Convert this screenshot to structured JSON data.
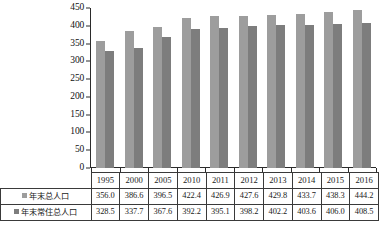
{
  "chart_data": {
    "type": "bar",
    "title": "",
    "xlabel": "",
    "ylabel": "",
    "ylim": [
      0,
      450
    ],
    "ytick_step": 50,
    "yticks": [
      0,
      50,
      100,
      150,
      200,
      250,
      300,
      350,
      400,
      450
    ],
    "grid": false,
    "legend_position": "table-row-headers",
    "categories": [
      "1995",
      "2000",
      "2005",
      "2010",
      "2011",
      "2012",
      "2013",
      "2014",
      "2015",
      "2016"
    ],
    "series": [
      {
        "name": "年末总人口",
        "color": "#9d9d9d",
        "values": [
          356.0,
          386.6,
          396.5,
          422.4,
          426.9,
          427.6,
          429.8,
          433.7,
          438.3,
          444.2
        ]
      },
      {
        "name": "年末常住总人口",
        "color": "#7d7d7d",
        "values": [
          328.5,
          337.7,
          367.6,
          392.2,
          395.1,
          398.2,
          402.2,
          403.6,
          406.0,
          408.5
        ]
      }
    ]
  },
  "table": {
    "corner_label": "",
    "column_headers": [
      "1995",
      "2000",
      "2005",
      "2010",
      "2011",
      "2012",
      "2013",
      "2014",
      "2015",
      "2016"
    ],
    "rows": [
      {
        "label": "年末总人口",
        "swatch_color": "#9d9d9d",
        "values": [
          "356.0",
          "386.6",
          "396.5",
          "422.4",
          "426.9",
          "427.6",
          "429.8",
          "433.7",
          "438.3",
          "444.2"
        ]
      },
      {
        "label": "年末常住总人口",
        "swatch_color": "#7d7d7d",
        "values": [
          "328.5",
          "337.7",
          "367.6",
          "392.2",
          "395.1",
          "398.2",
          "402.2",
          "403.6",
          "406.0",
          "408.5"
        ]
      }
    ]
  }
}
